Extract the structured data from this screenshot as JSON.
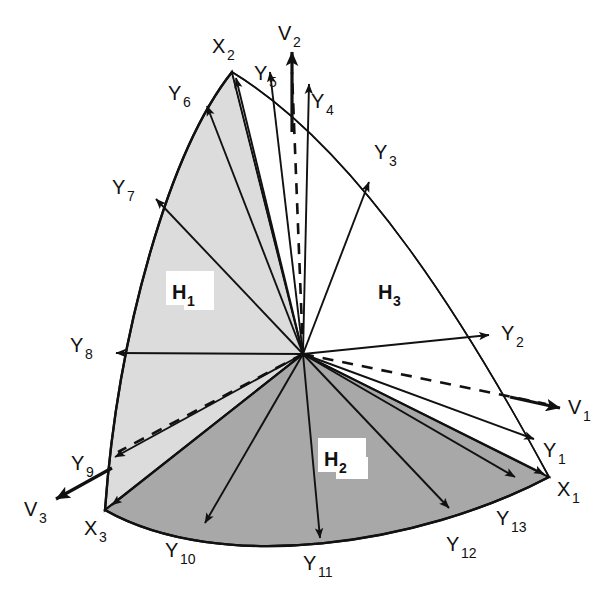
{
  "figure": {
    "background_color": "#ffffff",
    "stroke_color": "#111111",
    "region_fills": {
      "H1": "#dcdcdc",
      "H2": "#a8a8a8",
      "H3": "#ffffff"
    }
  },
  "regions": [
    {
      "id": "H1",
      "label": "H",
      "sub": "1",
      "fill": "#dcdcdc",
      "x": 186,
      "y": 294
    },
    {
      "id": "H2",
      "label": "H",
      "sub": "2",
      "fill": "#a8a8a8",
      "x": 338,
      "y": 461
    },
    {
      "id": "H3",
      "label": "H",
      "sub": "3",
      "fill": "#ffffff",
      "x": 383,
      "y": 294
    }
  ],
  "vertices": [
    {
      "id": "X1",
      "label": "X",
      "sub": "1",
      "px": 549,
      "py": 477,
      "label_x": 557,
      "label_y": 496
    },
    {
      "id": "X2",
      "label": "X",
      "sub": "2",
      "px": 232,
      "py": 72,
      "label_x": 214,
      "label_y": 52
    },
    {
      "id": "X3",
      "label": "X",
      "sub": "3",
      "px": 105,
      "py": 510,
      "label_x": 86,
      "label_y": 534
    }
  ],
  "v_vectors": [
    {
      "id": "V1",
      "label": "V",
      "sub": "1",
      "tip_x": 563,
      "tip_y": 408,
      "label_x": 571,
      "label_y": 414,
      "dashed": true
    },
    {
      "id": "V2",
      "label": "V",
      "sub": "2",
      "tip_x": 292,
      "tip_y": 48,
      "label_x": 283,
      "label_y": 40,
      "dashed": true
    },
    {
      "id": "V3",
      "label": "V",
      "sub": "3",
      "tip_x": 52,
      "tip_y": 500,
      "label_x": 28,
      "label_y": 516,
      "dashed": true
    }
  ],
  "y_vectors": [
    {
      "id": "Y1",
      "label": "Y",
      "sub": "1",
      "tip_x": 537,
      "tip_y": 440,
      "label_x": 546,
      "label_y": 457
    },
    {
      "id": "Y2",
      "label": "Y",
      "sub": "2",
      "tip_x": 492,
      "tip_y": 336,
      "label_x": 504,
      "label_y": 340
    },
    {
      "id": "Y3",
      "label": "Y",
      "sub": "3",
      "tip_x": 371,
      "tip_y": 180,
      "label_x": 378,
      "label_y": 158
    },
    {
      "id": "Y4",
      "label": "Y",
      "sub": "4",
      "tip_x": 309,
      "tip_y": 80,
      "label_x": 314,
      "label_y": 107
    },
    {
      "id": "Y5",
      "label": "Y",
      "sub": "5",
      "tip_x": 269,
      "tip_y": 68,
      "label_x": 259,
      "label_y": 79
    },
    {
      "id": "Y6",
      "label": "Y",
      "sub": "6",
      "tip_x": 204,
      "tip_y": 103,
      "label_x": 172,
      "label_y": 99
    },
    {
      "id": "Y7",
      "label": "Y",
      "sub": "7",
      "tip_x": 152,
      "tip_y": 196,
      "label_x": 116,
      "label_y": 193
    },
    {
      "id": "Y8",
      "label": "Y",
      "sub": "8",
      "tip_x": 113,
      "tip_y": 353,
      "label_x": 74,
      "label_y": 352
    },
    {
      "id": "Y9",
      "label": "Y",
      "sub": "9",
      "tip_x": 111,
      "tip_y": 459,
      "label_x": 75,
      "label_y": 470
    },
    {
      "id": "Y10",
      "label": "Y",
      "sub": "10",
      "tip_x": 203,
      "tip_y": 525,
      "label_x": 169,
      "label_y": 557
    },
    {
      "id": "Y11",
      "label": "Y",
      "sub": "11",
      "tip_x": 320,
      "tip_y": 541,
      "label_x": 309,
      "label_y": 570
    },
    {
      "id": "Y12",
      "label": "Y",
      "sub": "12",
      "tip_x": 451,
      "tip_y": 510,
      "label_x": 450,
      "label_y": 551
    },
    {
      "id": "Y13",
      "label": "Y",
      "sub": "13",
      "tip_x": 517,
      "tip_y": 478,
      "label_x": 500,
      "label_y": 525
    }
  ],
  "geometry": {
    "center_x": 303,
    "center_y": 354,
    "note": "All Y vectors radiate from the common center point"
  }
}
